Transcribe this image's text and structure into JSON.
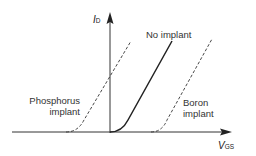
{
  "diagram": {
    "y_axis": {
      "symbol": "I",
      "subscript": "D"
    },
    "x_axis": {
      "symbol": "V",
      "subscript": "GS"
    },
    "curves": [
      {
        "name": "Phosphorus implant",
        "line1": "Phosphorus",
        "line2": "implant",
        "style": "dashed"
      },
      {
        "name": "No implant",
        "label": "No implant",
        "style": "solid"
      },
      {
        "name": "Boron implant",
        "line1": "Boron",
        "line2": "implant",
        "style": "dashed"
      }
    ],
    "colors": {
      "line": "#222222",
      "text": "#333333"
    }
  }
}
